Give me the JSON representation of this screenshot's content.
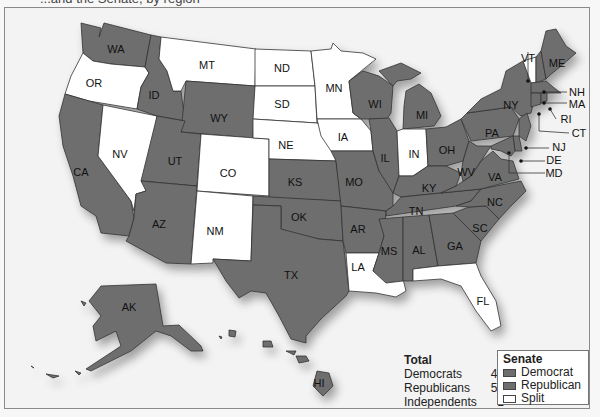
{
  "caption_partial": "...and the Senate, by region",
  "colors": {
    "democrat": "#6e6e6e",
    "republican": "#6e6e6e",
    "split": "#ffffff",
    "background": "#f3f3f3",
    "border": "#333333"
  },
  "totals": {
    "title": "Total",
    "rows": [
      {
        "label": "Democrats",
        "value": "44"
      },
      {
        "label": "Republicans",
        "value": "55"
      },
      {
        "label": "Independents",
        "value": "1"
      }
    ]
  },
  "legend": {
    "title": "Senate",
    "items": [
      {
        "label": "Democrat",
        "key": "dem"
      },
      {
        "label": "Republican",
        "key": "rep"
      },
      {
        "label": "Split",
        "key": "split"
      }
    ]
  },
  "states": {
    "WA": "WA",
    "OR": "OR",
    "CA": "CA",
    "NV": "NV",
    "ID": "ID",
    "MT": "MT",
    "WY": "WY",
    "UT": "UT",
    "AZ": "AZ",
    "CO": "CO",
    "NM": "NM",
    "ND": "ND",
    "SD": "SD",
    "NE": "NE",
    "KS": "KS",
    "OK": "OK",
    "TX": "TX",
    "MN": "MN",
    "IA": "IA",
    "MO": "MO",
    "AR": "AR",
    "LA": "LA",
    "WI": "WI",
    "IL": "IL",
    "MI": "MI",
    "IN": "IN",
    "OH": "OH",
    "KY": "KY",
    "TN": "TN",
    "MS": "MS",
    "AL": "AL",
    "GA": "GA",
    "FL": "FL",
    "SC": "SC",
    "NC": "NC",
    "VA": "VA",
    "WV": "WV",
    "PA": "PA",
    "NY": "NY",
    "VT": "VT",
    "ME": "ME",
    "NH": "NH",
    "MA": "MA",
    "RI": "RI",
    "CT": "CT",
    "NJ": "NJ",
    "DE": "DE",
    "MD": "MD",
    "AK": "AK",
    "HI": "HI"
  },
  "state_status": {
    "split": [
      "OR",
      "MT",
      "ND",
      "SD",
      "NE",
      "MN",
      "IA",
      "NV",
      "CO",
      "NM",
      "IN",
      "LA",
      "FL",
      "VT"
    ],
    "shaded": [
      "WA",
      "ID",
      "CA",
      "WY",
      "UT",
      "AZ",
      "KS",
      "OK",
      "TX",
      "MO",
      "AR",
      "WI",
      "IL",
      "MI",
      "OH",
      "KY",
      "TN",
      "MS",
      "AL",
      "GA",
      "SC",
      "NC",
      "VA",
      "WV",
      "PA",
      "NY",
      "ME",
      "NH",
      "MA",
      "RI",
      "CT",
      "NJ",
      "DE",
      "MD",
      "AK",
      "HI"
    ]
  }
}
